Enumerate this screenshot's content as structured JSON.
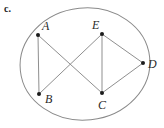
{
  "figure": {
    "part_label": "c.",
    "background_color": "#ffffff",
    "outline_color": "#8a8a8a",
    "chord_color": "#8f8f8f",
    "point_color": "#1b1b1b",
    "label_color": "#2a2a2a",
    "ellipse": {
      "cx": 85,
      "cy": 64,
      "rx": 65,
      "ry": 56,
      "rotation_deg": -6
    },
    "points": [
      {
        "name": "A",
        "label": "A",
        "x": 38,
        "y": 35,
        "label_x": 42,
        "label_y": 20
      },
      {
        "name": "E",
        "label": "E",
        "x": 102,
        "y": 34,
        "label_x": 92,
        "label_y": 19
      },
      {
        "name": "D",
        "label": "D",
        "x": 143,
        "y": 63,
        "label_x": 148,
        "label_y": 58
      },
      {
        "name": "B",
        "label": "B",
        "x": 39,
        "y": 94,
        "label_x": 45,
        "label_y": 93
      },
      {
        "name": "C",
        "label": "C",
        "x": 102,
        "y": 93,
        "label_x": 98,
        "label_y": 99
      }
    ],
    "segments": [
      {
        "name": "segment-AB",
        "from": "A",
        "to": "B",
        "x1": 38,
        "y1": 35,
        "x2": 39,
        "y2": 94
      },
      {
        "name": "segment-AC",
        "from": "A",
        "to": "C",
        "x1": 38,
        "y1": 35,
        "x2": 102,
        "y2": 93
      },
      {
        "name": "segment-EB",
        "from": "E",
        "to": "B",
        "x1": 102,
        "y1": 34,
        "x2": 39,
        "y2": 94
      },
      {
        "name": "segment-EC",
        "from": "E",
        "to": "C",
        "x1": 102,
        "y1": 34,
        "x2": 102,
        "y2": 93
      },
      {
        "name": "segment-ED",
        "from": "E",
        "to": "D",
        "x1": 102,
        "y1": 34,
        "x2": 143,
        "y2": 63
      },
      {
        "name": "segment-CD",
        "from": "C",
        "to": "D",
        "x1": 102,
        "y1": 93,
        "x2": 143,
        "y2": 63
      }
    ]
  }
}
